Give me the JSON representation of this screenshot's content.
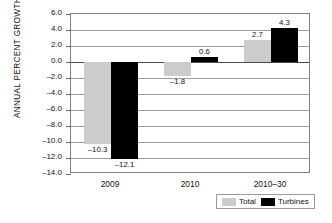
{
  "chart_data": {
    "type": "bar",
    "title": "",
    "xlabel": "",
    "ylabel": "ANNUAL PERCENT GROWTH",
    "categories": [
      "2009",
      "2010",
      "2010–30"
    ],
    "series": [
      {
        "name": "Total",
        "color": "#cccccc",
        "values": [
          -10.3,
          -1.8,
          2.7
        ]
      },
      {
        "name": "Turbines",
        "color": "#000000",
        "values": [
          -12.1,
          0.6,
          4.3
        ]
      }
    ],
    "value_labels": {
      "Total": [
        "–10.3",
        "–1.8",
        "2.7"
      ],
      "Turbines": [
        "–12.1",
        "0.6",
        "4.3"
      ]
    },
    "ylim": [
      -14.0,
      6.0
    ],
    "yticks": [
      6.0,
      4.0,
      2.0,
      0.0,
      -2.0,
      -4.0,
      -6.0,
      -8.0,
      -10.0,
      -12.0,
      -14.0
    ],
    "ytick_labels": [
      "6.0",
      "4.0",
      "2.0",
      "0.0",
      "–2.0",
      "–4.0",
      "–6.0",
      "–8.0",
      "–10.0",
      "–12.0",
      "–14.0"
    ],
    "grid": true,
    "legend_position": "bottom-right",
    "legend": [
      "Total",
      "Turbines"
    ]
  }
}
